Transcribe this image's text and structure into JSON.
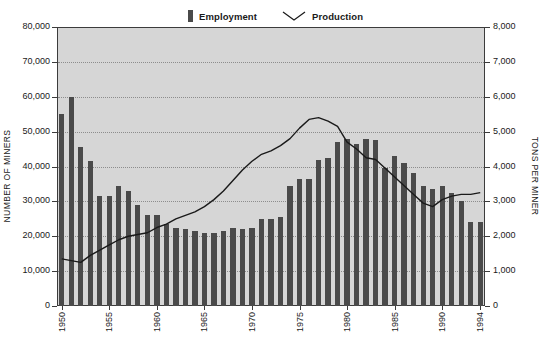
{
  "chart_data": {
    "type": "bar",
    "title": "",
    "legend": [
      {
        "label": "Employment",
        "marker": "bar-swatch",
        "color": "#4a4a4a"
      },
      {
        "label": "Production",
        "marker": "line-swatch",
        "color": "#1a1a1a"
      }
    ],
    "legend_position": "top-center",
    "grid": true,
    "xlabel": "",
    "x": [
      1950,
      1951,
      1952,
      1953,
      1954,
      1955,
      1956,
      1957,
      1958,
      1959,
      1960,
      1961,
      1962,
      1963,
      1964,
      1965,
      1966,
      1967,
      1968,
      1969,
      1970,
      1971,
      1972,
      1973,
      1974,
      1975,
      1976,
      1977,
      1978,
      1979,
      1980,
      1981,
      1982,
      1983,
      1984,
      1985,
      1986,
      1987,
      1988,
      1989,
      1990,
      1991,
      1992,
      1993,
      1994
    ],
    "xtick_labels": [
      "1950",
      "1955",
      "1960",
      "1965",
      "1970",
      "1975",
      "1980",
      "1985",
      "1990",
      "1994"
    ],
    "xtick_values": [
      1950,
      1955,
      1960,
      1965,
      1970,
      1975,
      1980,
      1985,
      1990,
      1994
    ],
    "series": [
      {
        "name": "Employment",
        "axis": "left",
        "kind": "bar",
        "color": "#4a4a4a",
        "values": [
          55000,
          60000,
          45500,
          41500,
          31500,
          31500,
          34500,
          33000,
          29000,
          26000,
          26000,
          23500,
          22500,
          22000,
          21500,
          21000,
          21000,
          21500,
          22500,
          22000,
          22500,
          25000,
          25000,
          25500,
          34500,
          36500,
          36500,
          42000,
          42500,
          47000,
          48000,
          46500,
          48000,
          47500,
          39500,
          43000,
          41000,
          38000,
          34500,
          33500,
          34500,
          32500,
          30000,
          24000,
          24000
        ]
      },
      {
        "name": "Production",
        "axis": "right",
        "kind": "line",
        "color": "#1a1a1a",
        "values": [
          1350,
          1300,
          1250,
          1450,
          1600,
          1750,
          1900,
          2000,
          2050,
          2100,
          2250,
          2350,
          2500,
          2600,
          2700,
          2850,
          3050,
          3300,
          3600,
          3900,
          4150,
          4350,
          4450,
          4600,
          4800,
          5100,
          5350,
          5400,
          5300,
          5150,
          4700,
          4500,
          4250,
          4200,
          3950,
          3700,
          3450,
          3200,
          2950,
          2850,
          3050,
          3150,
          3200,
          3200,
          3250
        ],
        "values_b": [
          4200,
          4300,
          3900,
          3450,
          3300,
          3200,
          3250,
          3200,
          3300,
          3500,
          4200,
          4600,
          5000,
          5200,
          5350,
          5650,
          5800,
          6100,
          6400,
          6500,
          6900,
          6950
        ]
      }
    ],
    "left_axis": {
      "label": "NUMBER OF MINERS",
      "min": 0,
      "max": 80000,
      "step": 10000,
      "ticks": [
        "0",
        "10,000",
        "20,000",
        "30,000",
        "40,000",
        "50,000",
        "60,000",
        "70,000",
        "80,000"
      ]
    },
    "right_axis": {
      "label": "TONS PER MINER",
      "min": 0,
      "max": 8000,
      "step": 1000,
      "ticks": [
        "0",
        "1,000",
        "2,000",
        "3,000",
        "4,000",
        "5,000",
        "6,000",
        "7,000",
        "8,000"
      ]
    }
  }
}
